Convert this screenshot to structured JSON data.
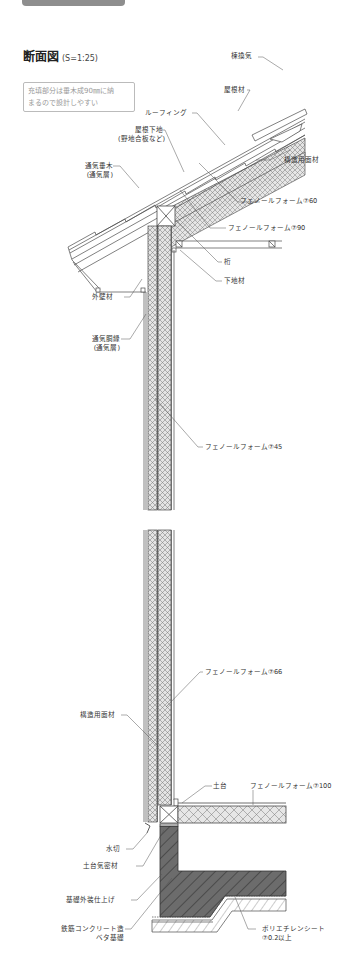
{
  "header": {
    "tab_label": "",
    "title": "断面図",
    "scale": "(S=1:25)"
  },
  "note": {
    "line1": "充填部分は垂木成90㎜に納",
    "line2": "まるので設計しやすい"
  },
  "labels": {
    "munekanki": "棟換気",
    "yanezai": "屋根材",
    "roofing": "ルーフィング",
    "yaneshitaji_1": "屋根下地",
    "yaneshitaji_2": "(野地合板など)",
    "tsukidaruki_1": "通気垂木",
    "tsukidaruki_2": "(通気層)",
    "kozomenzai_roof": "構造用面材",
    "phenol_60": "フェノールフォーム⑦60",
    "phenol_90": "フェノールフォーム⑦90",
    "keta": "桁",
    "shitajizai": "下地材",
    "gaiheki": "外壁材",
    "tsukidobuchi_1": "通気胴縁",
    "tsukidobuchi_2": "(通気層)",
    "phenol_45": "フェノールフォーム⑦45",
    "phenol_66": "フェノールフォーム⑦66",
    "kozomenzai_wall": "構造用面材",
    "dodai": "土台",
    "phenol_100": "フェノールフォーム⑦100",
    "mizukiri": "水切",
    "dodai_kimitsu": "土台気密材",
    "kiso_gaiso": "基礎外装仕上げ",
    "concrete_1": "鉄筋コンクリート造",
    "concrete_2": "ベタ基礎",
    "poly_1": "ポリエチレンシート",
    "poly_2": "⑦0.2以上"
  },
  "colors": {
    "line": "#4a4a4a",
    "insulation_fill": "#dcdcdc",
    "concrete_fill": "#6e6e6e",
    "tab": "#8e8e8e",
    "note_border": "#bbbbbb",
    "note_text": "#9a9a9a"
  }
}
